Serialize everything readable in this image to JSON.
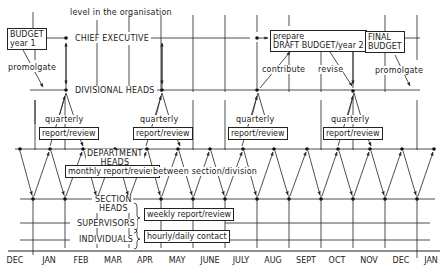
{
  "diagram": {
    "axis_title": "level in the organisation",
    "levels": [
      {
        "id": "chief",
        "label": "CHIEF EXECUTIVE"
      },
      {
        "id": "divisional",
        "label": "DIVISIONAL HEADS"
      },
      {
        "id": "department",
        "label": "DEPARTMENT\nHEADS",
        "line1": "DEPARTMENT",
        "line2": "HEADS"
      },
      {
        "id": "section",
        "label": "SECTION HEADS",
        "line1": "SECTION",
        "line2": "HEADS"
      },
      {
        "id": "supervisors",
        "label": "SUPERVISORS"
      },
      {
        "id": "individuals",
        "label": "INDIVIDUALS"
      }
    ],
    "boxes": {
      "budget_year1": {
        "line1": "BUDGET",
        "line2": "year 1"
      },
      "draft_budget": {
        "line1": "prepare",
        "line2": "DRAFT BUDGET/year 2"
      },
      "final_budget": {
        "line1": "FINAL",
        "line2": "BUDGET"
      },
      "quarterly_rr_1": "report/review",
      "quarterly_rr_2": "report/review",
      "quarterly_rr_3": "report/review",
      "quarterly_rr_4": "report/review",
      "monthly_rr": "monthly report/review",
      "weekly_rr": "weekly report/review",
      "hourly_contact": "hourly/daily contact"
    },
    "annotations": {
      "promolgate_left": "promolgate",
      "promolgate_right": "promolgate",
      "contribute": "contribute",
      "revise": "revise",
      "quarterly_1": "quarterly",
      "quarterly_2": "quarterly",
      "quarterly_3": "quarterly",
      "quarterly_4": "quarterly",
      "between": "between section/division"
    },
    "months": [
      "DEC",
      "JAN",
      "FEB",
      "MAR",
      "APR",
      "MAY",
      "JUNE",
      "JULY",
      "AUG",
      "SEPT",
      "OCT",
      "NOV",
      "DEC",
      "JAN"
    ]
  }
}
